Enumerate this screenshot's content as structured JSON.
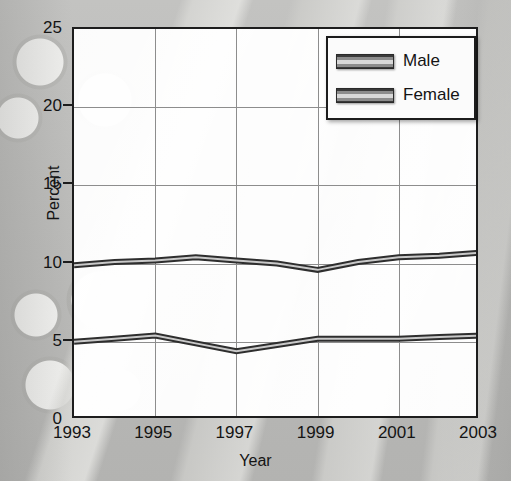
{
  "chart_data": {
    "type": "line",
    "title": "",
    "xlabel": "Year",
    "ylabel": "Percent",
    "x": [
      1993,
      1994,
      1995,
      1996,
      1997,
      1998,
      1999,
      2000,
      2001,
      2002,
      2003
    ],
    "xlim": [
      1993,
      2003
    ],
    "ylim": [
      0,
      25
    ],
    "xticks": [
      "1993",
      "1995",
      "1997",
      "1999",
      "2001",
      "2003"
    ],
    "xtick_values": [
      1993,
      1995,
      1997,
      1999,
      2001,
      2003
    ],
    "yticks": [
      "0",
      "5",
      "10",
      "15",
      "20",
      "25"
    ],
    "ytick_values": [
      0,
      5,
      10,
      15,
      20,
      25
    ],
    "grid": "both",
    "legend_position": "top-right",
    "series": [
      {
        "name": "Male",
        "color": "#2e2e2e",
        "values": [
          9.9,
          10.1,
          10.2,
          10.4,
          10.2,
          10.0,
          9.6,
          10.1,
          10.4,
          10.5,
          10.7
        ]
      },
      {
        "name": "Female",
        "color": "#2e2e2e",
        "values": [
          5.0,
          5.2,
          5.4,
          4.9,
          4.4,
          4.8,
          5.2,
          5.2,
          5.2,
          5.3,
          5.4
        ]
      }
    ]
  },
  "axes": {
    "y_title": "Percent",
    "x_title": "Year"
  },
  "legend": {
    "entries": [
      {
        "label": "Male"
      },
      {
        "label": "Female"
      }
    ]
  }
}
